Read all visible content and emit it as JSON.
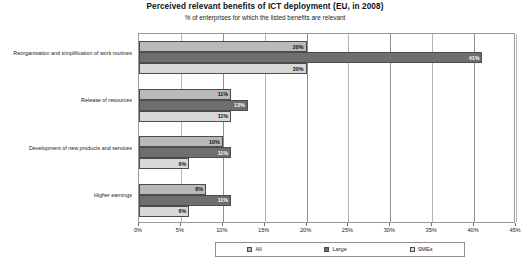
{
  "chart_data": {
    "type": "bar",
    "orientation": "horizontal",
    "title": "Perceived relevant benefits of ICT deployment (EU, in 2008)",
    "subtitle": "% of enterprises for which the listed benefits are relevant",
    "xlabel": "",
    "ylabel": "",
    "xlim": [
      0,
      45
    ],
    "xtick_labels": [
      "0%",
      "5%",
      "10%",
      "15%",
      "20%",
      "25%",
      "30%",
      "35%",
      "40%",
      "45%"
    ],
    "xtick_values": [
      0,
      5,
      10,
      15,
      20,
      25,
      30,
      35,
      40,
      45
    ],
    "grid": true,
    "legend_position": "bottom",
    "categories": [
      "Reorganisation and simplification of work routines",
      "Release of resources",
      "Development of new products and services",
      "Higher earnings"
    ],
    "series": [
      {
        "name": "All",
        "color": "#b9b9b9",
        "values": [
          20,
          11,
          10,
          8
        ],
        "labels": [
          "20%",
          "11%",
          "10%",
          "8%"
        ]
      },
      {
        "name": "Large",
        "color": "#6e6e6e",
        "values": [
          41,
          13,
          11,
          11
        ],
        "labels": [
          "41%",
          "13%",
          "11%",
          "11%"
        ]
      },
      {
        "name": "SMEs",
        "color": "#d8d8d8",
        "values": [
          20,
          11,
          6,
          6
        ],
        "labels": [
          "20%",
          "11%",
          "6%",
          "6%"
        ]
      }
    ]
  }
}
